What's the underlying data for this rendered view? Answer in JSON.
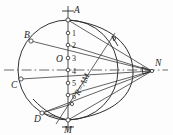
{
  "figure": {
    "background_color": "#fdfdfd",
    "line_color": "#333333",
    "label_color": "#1d1d1d"
  },
  "labels": {
    "A": "A",
    "B": "B",
    "C": "C",
    "D": "D",
    "M": "M",
    "N": "N",
    "O": "O",
    "radius_note": "R=AM"
  },
  "division_marks": {
    "values": [
      "1",
      "2",
      "3",
      "4",
      "5",
      "6"
    ]
  },
  "points": [
    {
      "name": "A",
      "label": "A",
      "x": 68,
      "y": 20
    },
    {
      "name": "B",
      "label": "B",
      "x": 31,
      "y": 41
    },
    {
      "name": "C",
      "label": "C",
      "x": 21,
      "y": 79
    },
    {
      "name": "D",
      "label": "D",
      "x": 42,
      "y": 113
    },
    {
      "name": "M",
      "label": "M",
      "x": 68,
      "y": 120
    },
    {
      "name": "N",
      "label": "N",
      "x": 152,
      "y": 71
    },
    {
      "name": "O",
      "label": "O",
      "x": 68,
      "y": 70
    }
  ],
  "axis": {
    "horizontal_label": "centerline",
    "vertical_label": "axis-AM"
  }
}
